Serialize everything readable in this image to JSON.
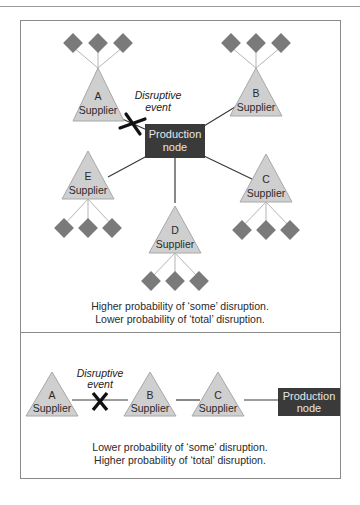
{
  "colors": {
    "supplier_fill": "#cfcfcf",
    "supplier_stroke": "#a8a8a8",
    "diamond_fill": "#7a7a7a",
    "node_fill": "#3a3a3a",
    "node_text": "#e6e6e6",
    "line": "#3a3a3a",
    "thin_line": "#b5b5b5"
  },
  "top_panel": {
    "suppliers": [
      {
        "letter": "A",
        "label": "Supplier"
      },
      {
        "letter": "B",
        "label": "Supplier"
      },
      {
        "letter": "C",
        "label": "Supplier"
      },
      {
        "letter": "D",
        "label": "Supplier"
      },
      {
        "letter": "E",
        "label": "Supplier"
      }
    ],
    "event_line1": "Disruptive",
    "event_line2": "event",
    "event_marker": "X",
    "node_line1": "Production",
    "node_line2": "node",
    "caption_line1": "Higher probability of ‘some’ disruption.",
    "caption_line2": "Lower probability of ‘total’ disruption."
  },
  "bottom_panel": {
    "suppliers": [
      {
        "letter": "A",
        "label": "Supplier"
      },
      {
        "letter": "B",
        "label": "Supplier"
      },
      {
        "letter": "C",
        "label": "Supplier"
      }
    ],
    "event_line1": "Disruptive",
    "event_line2": "event",
    "event_marker": "X",
    "node_line1": "Production",
    "node_line2": "node",
    "caption_line1": "Lower probability of ‘some’ disruption.",
    "caption_line2": "Higher probability of ‘total’ disruption."
  }
}
